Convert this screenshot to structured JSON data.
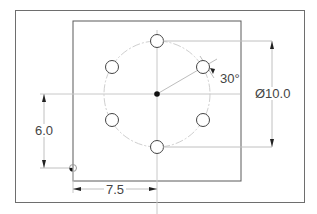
{
  "drawing": {
    "title": "Bolt hole circle plate drawing",
    "dimensions": {
      "bolt_circle_diameter": "Ø10.0",
      "angle": "30°",
      "vertical_offset": "6.0",
      "horizontal_offset": "7.5"
    },
    "features": {
      "hole_count": 6,
      "hole_spacing_deg": 60,
      "center_mark": "filled-dot"
    },
    "colors": {
      "outline": "#5a5a5a",
      "center_line": "#c8c8c8",
      "dim_line": "#bdbdbd",
      "text": "#444444"
    }
  }
}
